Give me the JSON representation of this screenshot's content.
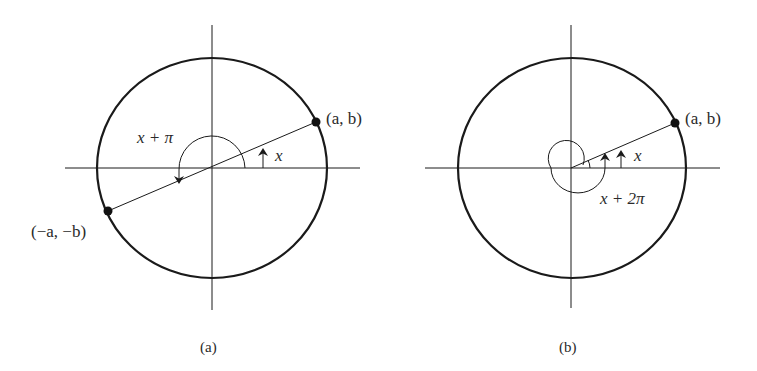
{
  "figure": {
    "panels": [
      {
        "id": "a",
        "caption": "(a)",
        "point_label": "(a, b)",
        "opposite_point_label": "(−a, −b)",
        "angle_label": "x",
        "extended_angle_label": "x + π"
      },
      {
        "id": "b",
        "caption": "(b)",
        "point_label": "(a, b)",
        "angle_label": "x",
        "extended_angle_label": "x + 2π"
      }
    ],
    "colors": {
      "stroke": "#1a1a1a",
      "text": "#2a2a2a",
      "background": "#ffffff"
    }
  }
}
